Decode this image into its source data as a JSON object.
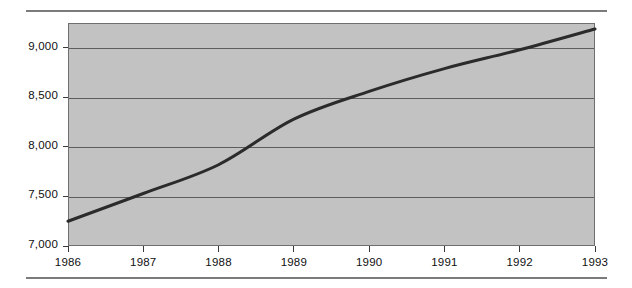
{
  "chart_data": {
    "type": "line",
    "title": "",
    "subtitle": "",
    "xlabel": "",
    "ylabel": "",
    "categories": [
      "1986",
      "1987",
      "1988",
      "1989",
      "1990",
      "1991",
      "1992",
      "1993"
    ],
    "x": [
      1986,
      1987,
      1988,
      1989,
      1990,
      1991,
      1992,
      1993
    ],
    "values": [
      7250,
      7530,
      7820,
      8280,
      8560,
      8790,
      8980,
      9190
    ],
    "series": [
      {
        "name": "",
        "values": [
          7250,
          7530,
          7820,
          8280,
          8560,
          8790,
          8980,
          9190
        ]
      }
    ],
    "xlim": [
      1986,
      1993
    ],
    "ylim": [
      7000,
      9250
    ],
    "ytick_values": [
      7000,
      7500,
      8000,
      8500,
      9000
    ],
    "ytick_labels": [
      "7,000",
      "7,500",
      "8,000",
      "8,500",
      "9,000"
    ],
    "xtick_labels": [
      "1986",
      "1987",
      "1988",
      "1989",
      "1990",
      "1991",
      "1992",
      "1993"
    ],
    "grid": true,
    "grid_axis": "y",
    "legend": false,
    "legend_position": "none",
    "annotations": [],
    "line_color": "#2b2b2b",
    "plot_background": "#c2c2c2",
    "grid_color": "#5d5d5d",
    "axis_color": "#6f6f6f",
    "rule_color": "#7b7b7b",
    "text_color": "#101010",
    "line_width": 3,
    "markers": false
  }
}
